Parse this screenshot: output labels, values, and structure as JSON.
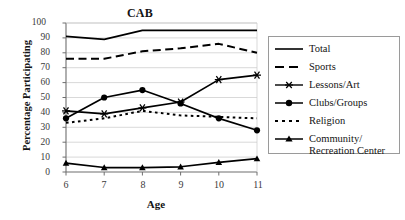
{
  "chart_data": {
    "type": "line",
    "title": "CAB",
    "xlabel": "Age",
    "ylabel": "Percentage Participating",
    "x": [
      6,
      7,
      8,
      9,
      10,
      11
    ],
    "xticklabels": [
      "6",
      "7",
      "8",
      "9",
      "10",
      "11"
    ],
    "yticklabels": [
      "0",
      "10",
      "20",
      "30",
      "40",
      "50",
      "60",
      "70",
      "80",
      "90",
      "100"
    ],
    "ylim": [
      0,
      100
    ],
    "xlim": [
      6,
      11
    ],
    "grid": true,
    "legend_position": "right",
    "series": [
      {
        "name": "Total",
        "values": [
          91,
          89,
          95,
          95,
          95,
          95
        ],
        "style": "solid",
        "marker": "none",
        "color": "#000000"
      },
      {
        "name": "Sports",
        "values": [
          76,
          76,
          81,
          83,
          86,
          80
        ],
        "style": "dashed",
        "marker": "none",
        "color": "#000000"
      },
      {
        "name": "Lessons/Art",
        "values": [
          41,
          39,
          43,
          47,
          62,
          65
        ],
        "style": "solid",
        "marker": "asterisk",
        "color": "#000000"
      },
      {
        "name": "Clubs/Groups",
        "values": [
          36,
          50,
          55,
          46,
          36,
          28
        ],
        "style": "solid",
        "marker": "circle",
        "color": "#000000"
      },
      {
        "name": "Religion",
        "values": [
          33,
          36,
          41,
          38,
          37,
          36
        ],
        "style": "dotted",
        "marker": "none",
        "color": "#000000"
      },
      {
        "name": "Community/\nRecreation Center",
        "values": [
          6,
          3,
          3,
          3.5,
          6.5,
          9
        ],
        "style": "solid",
        "marker": "triangle",
        "color": "#000000"
      }
    ]
  },
  "legend": {
    "items": [
      {
        "label": "Total"
      },
      {
        "label": "Sports"
      },
      {
        "label": "Lessons/Art"
      },
      {
        "label": "Clubs/Groups"
      },
      {
        "label": "Religion"
      },
      {
        "label": "Community/\nRecreation Center"
      }
    ]
  }
}
